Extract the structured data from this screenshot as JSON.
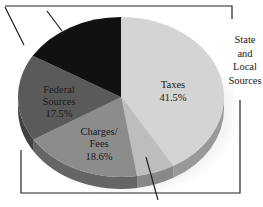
{
  "chart_data": {
    "type": "pie",
    "style": "3d-tilted",
    "title": "",
    "slices": [
      {
        "label": "Taxes",
        "value": 41.5,
        "value_label": "41.5%",
        "color": "#d4d4d4"
      },
      {
        "label": "",
        "value": 6.0,
        "value_label": "",
        "color": "#bdbdbd",
        "estimated": true
      },
      {
        "label": "Charges/ Fees",
        "value": 18.6,
        "value_label": "18.6%",
        "color": "#8c8c8c"
      },
      {
        "label": "Federal Sources",
        "value": 17.5,
        "value_label": "17.5%",
        "color": "#5a5a5a"
      },
      {
        "label": "",
        "value": 16.4,
        "value_label": "",
        "color": "#111111",
        "estimated": true
      }
    ],
    "annotations": [
      {
        "text": "State and Local Sources",
        "type": "bracket",
        "position": "right"
      }
    ],
    "legend": "none"
  },
  "labels": {
    "taxes_name": "Taxes",
    "taxes_pct": "41.5%",
    "federal_line1": "Federal",
    "federal_line2": "Sources",
    "federal_pct": "17.5%",
    "charges_line1": "Charges/",
    "charges_line2": "Fees",
    "charges_pct": "18.6%",
    "side_line1": "State",
    "side_line2": "and",
    "side_line3": "Local",
    "side_line4": "Sources"
  }
}
